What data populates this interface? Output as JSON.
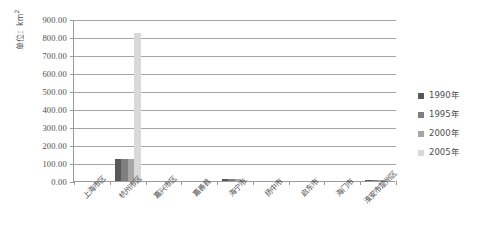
{
  "chart_data": {
    "type": "bar",
    "title": "",
    "subtitle": "",
    "xlabel": "",
    "ylabel": "单位：km",
    "ylabel_sup": "2",
    "categories": [
      "上海市区",
      "杭州市区",
      "嘉兴市区",
      "嘉善县",
      "海宁市",
      "扬中市",
      "启东市",
      "海门市",
      "淮安市楚州区"
    ],
    "series": [
      {
        "name": "1990年",
        "color": "#595959",
        "values": [
          0,
          125,
          0,
          0,
          10,
          0,
          0,
          0,
          4
        ]
      },
      {
        "name": "1995年",
        "color": "#7f7f7f",
        "values": [
          0,
          125,
          0,
          0,
          10,
          0,
          0,
          0,
          4
        ]
      },
      {
        "name": "2000年",
        "color": "#a6a6a6",
        "values": [
          0,
          125,
          0,
          0,
          9,
          0,
          0,
          0,
          4
        ]
      },
      {
        "name": "2005年",
        "color": "#d9d9d9",
        "values": [
          0,
          825,
          0,
          0,
          8,
          0,
          0,
          0,
          4
        ]
      }
    ],
    "ylim": [
      0,
      900
    ],
    "ytick_step": 100,
    "yticks": [
      "900.00",
      "800.00",
      "700.00",
      "600.00",
      "500.00",
      "400.00",
      "300.00",
      "200.00",
      "100.00",
      "0.00"
    ],
    "grid": true,
    "legend_position": "right"
  }
}
